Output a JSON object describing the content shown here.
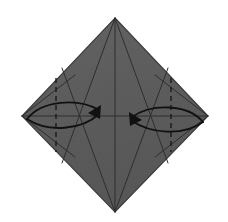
{
  "figure": {
    "kind": "origami-diagram",
    "canvas": {
      "width": 228,
      "height": 222
    },
    "background_color": "#ffffff"
  },
  "paper": {
    "name": "square-sheet-diamond",
    "fill_color": "#5a5a5a",
    "fill_color_light": "#646464",
    "fill_color_dark": "#515151",
    "outline_color": "#3a3a3a",
    "outline_width": 1.2,
    "vertices": {
      "top": {
        "x": 115,
        "y": 18
      },
      "right": {
        "x": 208,
        "y": 116
      },
      "bottom": {
        "x": 115,
        "y": 212
      },
      "left": {
        "x": 22,
        "y": 116
      }
    },
    "polygon_points": "115,18 208,116 115,212 22,116"
  },
  "creases": {
    "color": "#2e2e2e",
    "width": 1.0,
    "solid": [
      {
        "name": "vertical-center-crease",
        "x1": 115,
        "y1": 18,
        "x2": 115,
        "y2": 212
      },
      {
        "name": "horizontal-center-crease",
        "x1": 22,
        "y1": 116,
        "x2": 208,
        "y2": 116
      },
      {
        "name": "top-left-fan-crease",
        "x1": 115,
        "y1": 18,
        "x2": 62,
        "y2": 163
      },
      {
        "name": "top-right-fan-crease",
        "x1": 115,
        "y1": 18,
        "x2": 168,
        "y2": 163
      },
      {
        "name": "bottom-left-fan-crease",
        "x1": 115,
        "y1": 212,
        "x2": 62,
        "y2": 68
      },
      {
        "name": "bottom-right-fan-crease",
        "x1": 115,
        "y1": 212,
        "x2": 168,
        "y2": 68
      },
      {
        "name": "left-petal-upper-crease",
        "x1": 22,
        "y1": 116,
        "x2": 75,
        "y2": 75
      },
      {
        "name": "left-petal-lower-crease",
        "x1": 22,
        "y1": 116,
        "x2": 75,
        "y2": 157
      },
      {
        "name": "right-petal-upper-crease",
        "x1": 208,
        "y1": 116,
        "x2": 155,
        "y2": 75
      },
      {
        "name": "right-petal-lower-crease",
        "x1": 208,
        "y1": 116,
        "x2": 155,
        "y2": 157
      }
    ],
    "dashed": [
      {
        "name": "left-valley-fold-line",
        "x1": 56,
        "y1": 78,
        "x2": 56,
        "y2": 152,
        "dash": "5,4"
      },
      {
        "name": "right-valley-fold-line",
        "x1": 171,
        "y1": 78,
        "x2": 171,
        "y2": 152,
        "dash": "5,4"
      }
    ]
  },
  "arrows": {
    "color": "#111111",
    "width": 1.8,
    "items": [
      {
        "name": "left-fold-arrow",
        "direction": "right",
        "upper_path": "M 27,119 C 42,100 78,98 99,110",
        "lower_path": "M 27,119 C 48,133 82,130 99,114",
        "head_points": "101,105 88,113 100,119",
        "head_tip": {
          "x": 101,
          "y": 110
        }
      },
      {
        "name": "right-fold-arrow",
        "direction": "left",
        "upper_path": "M 203,122 C 188,104 152,103 132,117",
        "lower_path": "M 203,122 C 182,137 150,133 132,121",
        "head_points": "129,112 142,120 130,126",
        "head_tip": {
          "x": 129,
          "y": 118
        }
      }
    ]
  },
  "texture": {
    "name": "paper-grain",
    "opacity": 0.09,
    "seed_color": "#8a8a8a"
  }
}
